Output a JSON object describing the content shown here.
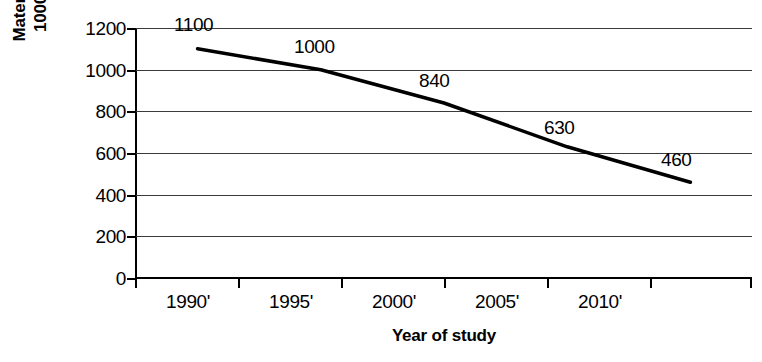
{
  "chart_data": {
    "type": "line",
    "title": "",
    "xlabel": "Year of study",
    "ylabel": "Maternal deaths per 100000 live births",
    "ylabel_line1": "Maternal deaths per",
    "ylabel_line2": "100000 live births",
    "categories": [
      "1990'",
      "1995'",
      "2000'",
      "2005'",
      "2010'"
    ],
    "values": [
      1100,
      1000,
      840,
      630,
      460
    ],
    "point_labels": [
      "1100",
      "1000",
      "840",
      "630",
      "460"
    ],
    "ylim": [
      0,
      1200
    ],
    "yticks": [
      0,
      200,
      400,
      600,
      800,
      1000,
      1200
    ],
    "ytick_labels": [
      "0",
      "200",
      "400",
      "600",
      "800",
      "1000",
      "1200"
    ],
    "grid": true,
    "grid_axis": "y",
    "legend": false,
    "legend_position": "none",
    "line_color": "#000000",
    "line_width": 3,
    "grid_color": "#3a3a3a",
    "background_color": "#ffffff"
  }
}
